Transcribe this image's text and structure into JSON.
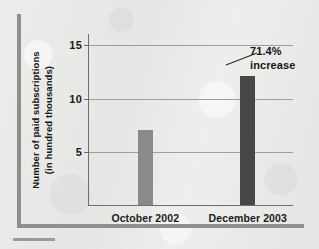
{
  "chart_data": {
    "type": "bar",
    "title": "",
    "subtitle": "",
    "xlabel": "",
    "ylabel": "Number of paid subscriptions\n(in hundred thousands)",
    "ylabel_line_1": "Number of paid subscriptions",
    "ylabel_line_2": "(in hundred thousands)",
    "categories": [
      "October 2002",
      "December 2003"
    ],
    "values": [
      7,
      12
    ],
    "ylim": [
      0,
      16
    ],
    "yticks": [
      "5",
      "10",
      "15"
    ],
    "ytick_values": [
      5,
      10,
      15
    ],
    "grid": true,
    "legend": false,
    "legend_position": "none",
    "bar_colors": [
      "#8a8a8a",
      "#474747"
    ],
    "annotations": [
      {
        "line_1": "71.4%",
        "line_2": "increase",
        "target_category": "December 2003",
        "target_value": 12
      }
    ]
  },
  "annotation": {
    "line_1": "71.4%",
    "line_2": "increase"
  },
  "colors": {
    "background": "#e9e9e7",
    "frame_rule": "#8f8f8f",
    "gridline": "#9e9e9e",
    "axis": "#6e6e6e",
    "text": "#1b1b1b",
    "bar_1": "#8a8a8a",
    "bar_2": "#474747"
  }
}
